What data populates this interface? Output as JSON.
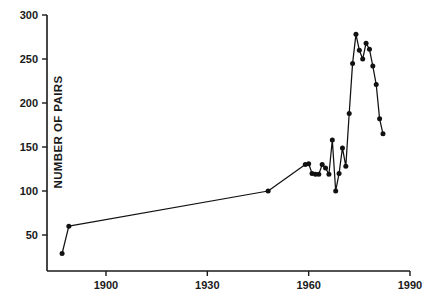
{
  "chart_data": {
    "type": "line",
    "title": "",
    "xlabel": "",
    "ylabel": "NUMBER OF PAIRS",
    "xlim": [
      1885,
      1990
    ],
    "ylim": [
      0,
      300
    ],
    "xticks": [
      1900,
      1930,
      1960,
      1990
    ],
    "xtick_labels": [
      "1900",
      "1930",
      "1960",
      "1990"
    ],
    "yticks": [
      50,
      100,
      150,
      200,
      250,
      300
    ],
    "ytick_labels": [
      "50",
      "100",
      "150",
      "200",
      "250",
      "300"
    ],
    "grid": false,
    "legend": "none",
    "marker": "filled-circle",
    "series": [
      {
        "name": "Number of pairs",
        "x": [
          1887,
          1889,
          1948,
          1959,
          1960,
          1961,
          1962,
          1963,
          1964,
          1965,
          1966,
          1967,
          1968,
          1969,
          1970,
          1971,
          1972,
          1973,
          1974,
          1975,
          1976,
          1977,
          1978,
          1979,
          1980,
          1981,
          1982,
          1983,
          1984,
          1985,
          1986,
          1987
        ],
        "y": [
          29,
          60,
          100,
          130,
          131,
          120,
          119,
          119,
          130,
          126,
          119,
          158,
          100,
          120,
          149,
          128,
          188,
          245,
          278,
          260,
          250,
          268,
          261,
          242,
          221,
          182,
          165,
          null,
          null,
          null,
          null,
          null
        ]
      }
    ],
    "points": [
      {
        "year": 1887,
        "value": 29
      },
      {
        "year": 1889,
        "value": 60
      },
      {
        "year": 1948,
        "value": 100
      },
      {
        "year": 1959,
        "value": 130
      },
      {
        "year": 1960,
        "value": 131
      },
      {
        "year": 1961,
        "value": 120
      },
      {
        "year": 1962,
        "value": 119
      },
      {
        "year": 1963,
        "value": 119
      },
      {
        "year": 1964,
        "value": 130
      },
      {
        "year": 1965,
        "value": 126
      },
      {
        "year": 1966,
        "value": 119
      },
      {
        "year": 1967,
        "value": 158
      },
      {
        "year": 1968,
        "value": 100
      },
      {
        "year": 1969,
        "value": 120
      },
      {
        "year": 1970,
        "value": 149
      },
      {
        "year": 1971,
        "value": 128
      },
      {
        "year": 1972,
        "value": 188
      },
      {
        "year": 1973,
        "value": 245
      },
      {
        "year": 1974,
        "value": 278
      },
      {
        "year": 1975,
        "value": 260
      },
      {
        "year": 1976,
        "value": 250
      },
      {
        "year": 1977,
        "value": 268
      },
      {
        "year": 1978,
        "value": 261
      },
      {
        "year": 1979,
        "value": 242
      },
      {
        "year": 1980,
        "value": 221
      },
      {
        "year": 1981,
        "value": 182
      },
      {
        "year": 1982,
        "value": 165
      }
    ]
  },
  "colors": {
    "line": "#111111",
    "marker": "#111111",
    "axis": "#1a1a1a",
    "background": "#ffffff"
  }
}
